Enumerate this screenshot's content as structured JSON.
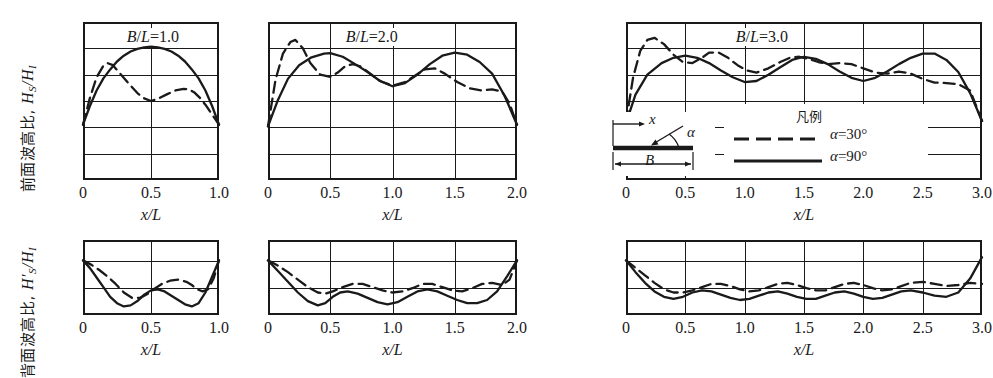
{
  "figure": {
    "y_axis_label_top": "前面波高比,",
    "y_axis_label_top_math": "H_S/H_I",
    "y_axis_label_bottom": "背面波高比,",
    "y_axis_label_bottom_math": "H'_S/H_I",
    "x_axis_label": "x/L"
  },
  "legend": {
    "title": "凡例",
    "entries": [
      {
        "label": "α = 30°",
        "style": "dashed",
        "color": "#1a1a1a"
      },
      {
        "label": "α = 90°",
        "style": "solid",
        "color": "#1a1a1a"
      }
    ]
  },
  "inset": {
    "x_label": "x",
    "alpha_label": "α",
    "b_label": "B"
  },
  "ticks": {
    "x_1": [
      "0",
      "0.5",
      "1.0"
    ],
    "x_2": [
      "0",
      "0.5",
      "1.0",
      "1.5",
      "2.0"
    ],
    "x_3": [
      "0",
      "0.5",
      "1.0",
      "1.5",
      "2.0",
      "2.5",
      "3.0"
    ],
    "y_top": [
      "0",
      "1.0",
      "2.0",
      "3.0"
    ],
    "y_bottom": [
      "0",
      "1.0"
    ]
  },
  "chart_data": {
    "type": "line",
    "xlabel": "x/L",
    "ylabel_top": "H_S/H_I",
    "ylabel_bottom": "H'_S/H_I",
    "grid": true,
    "legend_position": "inside-top-right-panel",
    "panels": [
      {
        "id": "top-1",
        "row": "front",
        "title": "B/L = 1.0",
        "xlim": [
          0,
          1.0
        ],
        "ylim": [
          0,
          3.0
        ],
        "yticks": [
          0,
          1.0,
          2.0,
          3.0
        ],
        "ygridlines": [
          0.5,
          1.0,
          1.5,
          2.0,
          2.5
        ],
        "xticks": [
          0,
          0.5,
          1.0
        ],
        "series": [
          {
            "name": "α = 90°",
            "style": "solid",
            "x": [
              0.0,
              0.05,
              0.1,
              0.15,
              0.2,
              0.25,
              0.3,
              0.35,
              0.4,
              0.45,
              0.5,
              0.55,
              0.6,
              0.65,
              0.7,
              0.75,
              0.8,
              0.85,
              0.9,
              0.95,
              1.0
            ],
            "y": [
              1.05,
              1.4,
              1.7,
              1.93,
              2.1,
              2.25,
              2.36,
              2.44,
              2.49,
              2.52,
              2.53,
              2.52,
              2.49,
              2.44,
              2.36,
              2.25,
              2.1,
              1.93,
              1.7,
              1.4,
              1.05
            ]
          },
          {
            "name": "α = 30°",
            "style": "dashed",
            "x": [
              0.0,
              0.05,
              0.1,
              0.15,
              0.18,
              0.22,
              0.28,
              0.34,
              0.4,
              0.45,
              0.5,
              0.55,
              0.62,
              0.68,
              0.74,
              0.78,
              0.82,
              0.86,
              0.9,
              0.95,
              1.0
            ],
            "y": [
              1.05,
              1.55,
              1.95,
              2.17,
              2.22,
              2.18,
              2.0,
              1.82,
              1.65,
              1.55,
              1.5,
              1.54,
              1.63,
              1.7,
              1.73,
              1.72,
              1.66,
              1.56,
              1.43,
              1.24,
              1.05
            ]
          }
        ]
      },
      {
        "id": "top-2",
        "row": "front",
        "title": "B/L = 2.0",
        "xlim": [
          0,
          2.0
        ],
        "ylim": [
          0,
          3.0
        ],
        "yticks": [
          0,
          1.0,
          2.0,
          3.0
        ],
        "ygridlines": [
          0.5,
          1.0,
          1.5,
          2.0,
          2.5
        ],
        "xticks": [
          0,
          0.5,
          1.0,
          1.5,
          2.0
        ],
        "series": [
          {
            "name": "α = 90°",
            "style": "solid",
            "x": [
              0.0,
              0.08,
              0.16,
              0.25,
              0.35,
              0.45,
              0.5,
              0.6,
              0.7,
              0.8,
              0.9,
              1.0,
              1.1,
              1.2,
              1.3,
              1.4,
              1.5,
              1.6,
              1.7,
              1.8,
              1.9,
              2.0
            ],
            "y": [
              1.02,
              1.52,
              1.92,
              2.18,
              2.33,
              2.4,
              2.41,
              2.34,
              2.2,
              2.05,
              1.88,
              1.78,
              1.84,
              2.0,
              2.2,
              2.36,
              2.42,
              2.38,
              2.24,
              2.02,
              1.6,
              1.05
            ]
          },
          {
            "name": "α = 30°",
            "style": "dashed",
            "x": [
              0.0,
              0.06,
              0.12,
              0.18,
              0.22,
              0.28,
              0.34,
              0.42,
              0.5,
              0.56,
              0.62,
              0.68,
              0.74,
              0.82,
              0.9,
              1.0,
              1.1,
              1.18,
              1.26,
              1.34,
              1.42,
              1.52,
              1.62,
              1.72,
              1.8,
              1.88,
              1.94,
              2.0
            ],
            "y": [
              1.02,
              1.9,
              2.4,
              2.62,
              2.66,
              2.5,
              2.22,
              2.0,
              1.96,
              2.04,
              2.16,
              2.2,
              2.16,
              2.02,
              1.88,
              1.79,
              1.86,
              1.98,
              2.1,
              2.12,
              2.02,
              1.86,
              1.74,
              1.7,
              1.72,
              1.68,
              1.45,
              1.05
            ]
          }
        ]
      },
      {
        "id": "top-3",
        "row": "front",
        "title": "B/L = 3.0",
        "xlim": [
          0,
          3.0
        ],
        "ylim": [
          0,
          3.0
        ],
        "yticks": [
          0,
          1.0,
          2.0,
          3.0
        ],
        "ygridlines": [
          0.5,
          1.0,
          1.5,
          2.0,
          2.5
        ],
        "xticks": [
          0,
          0.5,
          1.0,
          1.5,
          2.0,
          2.5,
          3.0
        ],
        "series": [
          {
            "name": "α = 90°",
            "style": "solid",
            "x": [
              0.0,
              0.08,
              0.18,
              0.3,
              0.4,
              0.5,
              0.6,
              0.7,
              0.8,
              0.9,
              1.0,
              1.1,
              1.2,
              1.3,
              1.4,
              1.5,
              1.6,
              1.7,
              1.8,
              1.9,
              2.0,
              2.1,
              2.2,
              2.3,
              2.4,
              2.5,
              2.6,
              2.7,
              2.8,
              2.9,
              3.0
            ],
            "y": [
              1.08,
              1.62,
              2.0,
              2.22,
              2.32,
              2.36,
              2.32,
              2.22,
              2.08,
              1.95,
              1.86,
              1.88,
              2.0,
              2.14,
              2.28,
              2.34,
              2.3,
              2.2,
              2.06,
              1.94,
              1.88,
              1.94,
              2.06,
              2.2,
              2.32,
              2.4,
              2.4,
              2.28,
              2.05,
              1.65,
              1.12
            ]
          },
          {
            "name": "α = 30°",
            "style": "dashed",
            "x": [
              0.0,
              0.06,
              0.12,
              0.18,
              0.24,
              0.32,
              0.4,
              0.48,
              0.56,
              0.64,
              0.7,
              0.78,
              0.86,
              0.94,
              1.02,
              1.1,
              1.2,
              1.3,
              1.38,
              1.46,
              1.54,
              1.62,
              1.7,
              1.8,
              1.9,
              2.0,
              2.1,
              2.2,
              2.3,
              2.4,
              2.5,
              2.6,
              2.7,
              2.8,
              2.9,
              3.0
            ],
            "y": [
              1.1,
              1.95,
              2.45,
              2.66,
              2.7,
              2.58,
              2.38,
              2.24,
              2.22,
              2.32,
              2.42,
              2.42,
              2.32,
              2.18,
              2.08,
              2.04,
              2.12,
              2.24,
              2.32,
              2.34,
              2.3,
              2.24,
              2.2,
              2.22,
              2.2,
              2.12,
              2.04,
              2.02,
              2.06,
              2.02,
              1.92,
              1.85,
              1.84,
              1.82,
              1.7,
              1.12
            ]
          }
        ]
      },
      {
        "id": "bottom-1",
        "row": "back",
        "title": "",
        "xlim": [
          0,
          1.0
        ],
        "ylim": [
          0,
          1.4
        ],
        "yticks": [
          0,
          1.0
        ],
        "ygridlines": [
          0.5,
          1.0
        ],
        "xticks": [
          0,
          0.5,
          1.0
        ],
        "series": [
          {
            "name": "α = 90°",
            "style": "solid",
            "x": [
              0.0,
              0.05,
              0.1,
              0.15,
              0.2,
              0.25,
              0.3,
              0.35,
              0.4,
              0.45,
              0.5,
              0.55,
              0.6,
              0.65,
              0.7,
              0.75,
              0.8,
              0.85,
              0.9,
              0.95,
              1.0
            ],
            "y": [
              1.02,
              0.88,
              0.7,
              0.52,
              0.34,
              0.22,
              0.16,
              0.18,
              0.26,
              0.38,
              0.46,
              0.48,
              0.44,
              0.36,
              0.28,
              0.2,
              0.16,
              0.22,
              0.42,
              0.72,
              1.02
            ]
          },
          {
            "name": "α = 30°",
            "style": "dashed",
            "x": [
              0.0,
              0.06,
              0.12,
              0.18,
              0.24,
              0.3,
              0.36,
              0.42,
              0.48,
              0.52,
              0.58,
              0.64,
              0.7,
              0.76,
              0.8,
              0.84,
              0.88,
              0.92,
              0.96,
              1.0
            ],
            "y": [
              1.02,
              0.94,
              0.84,
              0.72,
              0.58,
              0.42,
              0.32,
              0.32,
              0.4,
              0.48,
              0.58,
              0.64,
              0.66,
              0.62,
              0.56,
              0.48,
              0.44,
              0.48,
              0.68,
              1.02
            ]
          }
        ]
      },
      {
        "id": "bottom-2",
        "row": "back",
        "title": "",
        "xlim": [
          0,
          2.0
        ],
        "ylim": [
          0,
          1.4
        ],
        "yticks": [
          0,
          1.0
        ],
        "ygridlines": [
          0.5,
          1.0
        ],
        "xticks": [
          0,
          0.5,
          1.0,
          1.5,
          2.0
        ],
        "series": [
          {
            "name": "α = 90°",
            "style": "solid",
            "x": [
              0.0,
              0.08,
              0.16,
              0.24,
              0.32,
              0.4,
              0.46,
              0.52,
              0.58,
              0.64,
              0.72,
              0.8,
              0.88,
              0.96,
              1.04,
              1.12,
              1.2,
              1.28,
              1.36,
              1.44,
              1.52,
              1.6,
              1.68,
              1.76,
              1.84,
              1.92,
              2.0
            ],
            "y": [
              1.02,
              0.82,
              0.62,
              0.42,
              0.26,
              0.18,
              0.22,
              0.34,
              0.42,
              0.44,
              0.4,
              0.32,
              0.24,
              0.2,
              0.24,
              0.34,
              0.44,
              0.48,
              0.44,
              0.36,
              0.28,
              0.22,
              0.22,
              0.28,
              0.44,
              0.72,
              1.02
            ]
          },
          {
            "name": "α = 30°",
            "style": "dashed",
            "x": [
              0.0,
              0.08,
              0.16,
              0.24,
              0.32,
              0.4,
              0.46,
              0.52,
              0.6,
              0.68,
              0.76,
              0.84,
              0.92,
              1.0,
              1.08,
              1.16,
              1.24,
              1.32,
              1.4,
              1.48,
              1.56,
              1.64,
              1.72,
              1.8,
              1.88,
              1.94,
              2.0
            ],
            "y": [
              1.02,
              0.92,
              0.8,
              0.66,
              0.52,
              0.42,
              0.4,
              0.44,
              0.52,
              0.58,
              0.58,
              0.52,
              0.46,
              0.42,
              0.44,
              0.5,
              0.58,
              0.58,
              0.52,
              0.46,
              0.44,
              0.5,
              0.58,
              0.6,
              0.56,
              0.66,
              1.02
            ]
          }
        ]
      },
      {
        "id": "bottom-3",
        "row": "back",
        "title": "",
        "xlim": [
          0,
          3.0
        ],
        "ylim": [
          0,
          1.4
        ],
        "yticks": [
          0,
          1.0
        ],
        "ygridlines": [
          0.5,
          1.0
        ],
        "xticks": [
          0,
          0.5,
          1.0,
          1.5,
          2.0,
          2.5,
          3.0
        ],
        "series": [
          {
            "name": "α = 90°",
            "style": "solid",
            "x": [
              0.0,
              0.08,
              0.16,
              0.24,
              0.32,
              0.4,
              0.48,
              0.56,
              0.64,
              0.72,
              0.8,
              0.88,
              0.96,
              1.04,
              1.12,
              1.2,
              1.28,
              1.36,
              1.44,
              1.52,
              1.6,
              1.68,
              1.76,
              1.84,
              1.92,
              2.0,
              2.08,
              2.16,
              2.24,
              2.32,
              2.4,
              2.5,
              2.6,
              2.7,
              2.8,
              2.9,
              3.0
            ],
            "y": [
              1.02,
              0.8,
              0.6,
              0.44,
              0.34,
              0.3,
              0.34,
              0.42,
              0.46,
              0.44,
              0.38,
              0.32,
              0.28,
              0.3,
              0.36,
              0.42,
              0.44,
              0.4,
              0.34,
              0.3,
              0.3,
              0.36,
              0.42,
              0.44,
              0.4,
              0.34,
              0.3,
              0.32,
              0.38,
              0.44,
              0.46,
              0.42,
              0.36,
              0.34,
              0.42,
              0.68,
              1.08
            ]
          },
          {
            "name": "α = 30°",
            "style": "dashed",
            "x": [
              0.0,
              0.08,
              0.16,
              0.24,
              0.32,
              0.4,
              0.48,
              0.56,
              0.64,
              0.72,
              0.8,
              0.88,
              0.96,
              1.04,
              1.12,
              1.2,
              1.28,
              1.36,
              1.44,
              1.52,
              1.6,
              1.68,
              1.76,
              1.84,
              1.92,
              2.0,
              2.08,
              2.16,
              2.24,
              2.32,
              2.4,
              2.5,
              2.6,
              2.7,
              2.8,
              2.9,
              3.0
            ],
            "y": [
              1.02,
              0.88,
              0.74,
              0.6,
              0.48,
              0.42,
              0.42,
              0.46,
              0.52,
              0.58,
              0.58,
              0.54,
              0.48,
              0.44,
              0.46,
              0.52,
              0.58,
              0.6,
              0.56,
              0.5,
              0.46,
              0.46,
              0.52,
              0.58,
              0.6,
              0.56,
              0.5,
              0.46,
              0.48,
              0.54,
              0.6,
              0.62,
              0.58,
              0.54,
              0.56,
              0.6,
              0.58
            ]
          }
        ]
      }
    ]
  }
}
